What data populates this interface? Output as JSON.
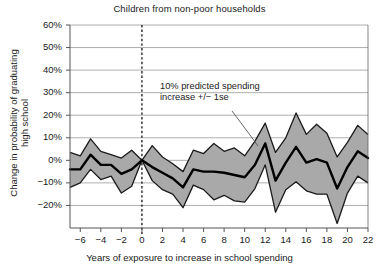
{
  "chart_data": {
    "type": "area",
    "title": "Children from non-poor households",
    "xlabel": "Years of exposure to increase in school spending",
    "ylabel_line1": "Change in probability of graduating",
    "ylabel_line2": "high school",
    "annotation_line1": "10% predicted spending",
    "annotation_line2": "increase +/− 1se",
    "xlim": [
      -7,
      22
    ],
    "ylim": [
      -30,
      60
    ],
    "grid": true,
    "legend": "none",
    "yticks": [
      -20,
      -10,
      0,
      10,
      20,
      30,
      40,
      50,
      60
    ],
    "ytick_labels": [
      "−20%",
      "−10%",
      "0%",
      "10%",
      "20%",
      "30%",
      "40%",
      "50%",
      "60%"
    ],
    "xticks": [
      -6,
      -4,
      -2,
      0,
      2,
      4,
      6,
      8,
      10,
      12,
      14,
      16,
      18,
      20,
      22
    ],
    "xtick_labels": [
      "−6",
      "−4",
      "−2",
      "0",
      "2",
      "4",
      "6",
      "8",
      "10",
      "12",
      "14",
      "16",
      "18",
      "20",
      "22"
    ],
    "reference_line_x": 0,
    "reference_line_style": "dashed",
    "colors": {
      "band_fill": "#a9a9a9",
      "band_edge": "#1a1a1a",
      "center_line": "#000000",
      "grid": "#9a9a9a",
      "axis": "#555555",
      "background": "#ffffff"
    },
    "x": [
      -7,
      -6,
      -5,
      -4,
      -3,
      -2,
      -1,
      0,
      1,
      2,
      3,
      4,
      5,
      6,
      7,
      8,
      9,
      10,
      11,
      12,
      13,
      14,
      15,
      16,
      17,
      18,
      19,
      20,
      21,
      22
    ],
    "series": [
      {
        "name": "10% predicted spending increase",
        "role": "center",
        "values": [
          -4.0,
          -4.0,
          2.5,
          -2.0,
          -2.0,
          -6.0,
          -4.0,
          0.0,
          -3.0,
          -5.5,
          -8.0,
          -12.0,
          -4.0,
          -5.0,
          -5.0,
          -5.5,
          -6.5,
          -7.5,
          -2.0,
          7.5,
          -9.0,
          -1.0,
          6.0,
          -1.0,
          0.5,
          -1.0,
          -12.5,
          -3.0,
          4.0,
          1.0
        ]
      },
      {
        "name": "upper 1se",
        "role": "upper",
        "values": [
          3.5,
          2.0,
          9.5,
          4.0,
          2.5,
          1.0,
          4.5,
          0.0,
          6.5,
          1.5,
          -1.5,
          -5.0,
          4.5,
          3.0,
          7.5,
          4.0,
          5.5,
          2.0,
          8.5,
          16.5,
          3.5,
          10.0,
          21.0,
          11.5,
          16.0,
          12.0,
          1.5,
          8.0,
          15.5,
          11.5
        ]
      },
      {
        "name": "lower 1se",
        "role": "lower",
        "values": [
          -12.0,
          -10.0,
          -4.0,
          -8.5,
          -7.0,
          -14.5,
          -11.5,
          0.0,
          -9.0,
          -13.0,
          -15.0,
          -21.0,
          -11.0,
          -13.0,
          -17.5,
          -15.5,
          -18.0,
          -18.5,
          -12.5,
          -2.0,
          -23.0,
          -13.0,
          -9.5,
          -13.5,
          -15.0,
          -15.0,
          -28.0,
          -14.5,
          -7.0,
          -10.0
        ]
      }
    ]
  }
}
